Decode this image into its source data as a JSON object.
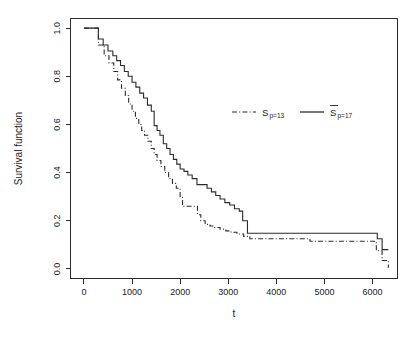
{
  "chart_data": {
    "type": "line",
    "title": "",
    "xlabel": "t",
    "ylabel": "Survival function",
    "xlim": [
      -280,
      6520
    ],
    "ylim": [
      -0.04,
      1.04
    ],
    "xticks": [
      0,
      1000,
      2000,
      3000,
      4000,
      5000,
      6000
    ],
    "xticklabels": [
      "0",
      "1000",
      "2000",
      "3000",
      "4000",
      "5000",
      "6000"
    ],
    "yticks": [
      0.0,
      0.2,
      0.4,
      0.6,
      0.8,
      1.0
    ],
    "yticklabels": [
      "0.0",
      "0.2",
      "0.4",
      "0.6",
      "0.8",
      "1.0"
    ],
    "grid": false,
    "step_type": "post",
    "legend": {
      "position": "upper-right-inside",
      "entries": [
        {
          "label": "S",
          "subscript": "p=13",
          "overline": false,
          "style": "dash-dot",
          "color": "#2b2b2b"
        },
        {
          "label": "S",
          "subscript": "p=17",
          "overline": true,
          "style": "solid",
          "color": "#2b2b2b"
        }
      ]
    },
    "series": [
      {
        "name": "S_p=13",
        "style": "dash-dot",
        "color": "#2b2b2b",
        "x": [
          0,
          200,
          300,
          420,
          520,
          620,
          700,
          780,
          860,
          930,
          1000,
          1070,
          1140,
          1200,
          1260,
          1330,
          1400,
          1460,
          1520,
          1600,
          1680,
          1760,
          1840,
          1920,
          2000,
          2050,
          2300,
          2360,
          2430,
          2520,
          2620,
          2720,
          2830,
          2950,
          3060,
          3180,
          3320,
          3450,
          4700,
          6080,
          6140,
          6200,
          6330
        ],
        "y": [
          1.0,
          1.0,
          0.93,
          0.885,
          0.855,
          0.82,
          0.785,
          0.75,
          0.72,
          0.685,
          0.655,
          0.625,
          0.6,
          0.575,
          0.555,
          0.53,
          0.5,
          0.475,
          0.45,
          0.425,
          0.4,
          0.375,
          0.355,
          0.335,
          0.3,
          0.26,
          0.26,
          0.225,
          0.2,
          0.185,
          0.178,
          0.172,
          0.165,
          0.158,
          0.152,
          0.145,
          0.135,
          0.125,
          0.115,
          0.075,
          0.075,
          0.035,
          0.005
        ]
      },
      {
        "name": "S_p=17",
        "style": "solid",
        "color": "#2b2b2b",
        "x": [
          0,
          200,
          300,
          400,
          500,
          600,
          680,
          760,
          840,
          920,
          1000,
          1080,
          1160,
          1240,
          1320,
          1400,
          1460,
          1520,
          1580,
          1650,
          1720,
          1790,
          1860,
          1930,
          2000,
          2080,
          2160,
          2250,
          2350,
          2480,
          2560,
          2650,
          2740,
          2830,
          2930,
          3030,
          3130,
          3230,
          3300,
          3400,
          4680,
          6100,
          6200,
          6330
        ],
        "y": [
          1.0,
          1.0,
          0.955,
          0.93,
          0.905,
          0.885,
          0.865,
          0.845,
          0.82,
          0.8,
          0.775,
          0.755,
          0.73,
          0.71,
          0.68,
          0.655,
          0.595,
          0.575,
          0.555,
          0.52,
          0.5,
          0.475,
          0.455,
          0.435,
          0.415,
          0.405,
          0.39,
          0.375,
          0.35,
          0.35,
          0.335,
          0.32,
          0.305,
          0.29,
          0.275,
          0.265,
          0.25,
          0.24,
          0.2,
          0.148,
          0.148,
          0.125,
          0.08,
          0.08
        ]
      }
    ]
  }
}
